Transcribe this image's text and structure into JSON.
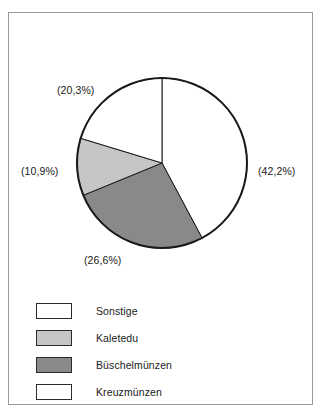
{
  "chart_data": {
    "type": "pie",
    "title": "",
    "subtitle": "",
    "xlabel": "",
    "ylabel": "",
    "legend_position": "bottom-left",
    "grid": false,
    "start_angle_deg": 0,
    "direction": "clockwise",
    "categories": [
      "Kreuzmünzen",
      "Büschelmünzen",
      "Kaletedu",
      "Sonstige"
    ],
    "values": [
      42.2,
      26.6,
      10.9,
      20.3
    ],
    "value_labels": [
      "(42,2%)",
      "(26,6%)",
      "(10,9%)",
      "(20,3%)"
    ],
    "colors": [
      "#ffffff",
      "#898989",
      "#c6c6c6",
      "#ffffff"
    ],
    "slices": [
      {
        "name": "Kreuzmünzen",
        "value": 42.2,
        "label": "(42,2%)",
        "color": "#ffffff",
        "start_deg": 0,
        "end_deg": 151.9,
        "label_position": "right"
      },
      {
        "name": "Büschelmünzen",
        "value": 26.6,
        "label": "(26,6%)",
        "color": "#898989",
        "start_deg": 151.9,
        "end_deg": 247.7,
        "label_position": "bottom"
      },
      {
        "name": "Kaletedu",
        "value": 10.9,
        "label": "(10,9%)",
        "color": "#c6c6c6",
        "start_deg": 247.7,
        "end_deg": 286.9,
        "label_position": "left"
      },
      {
        "name": "Sonstige",
        "value": 20.3,
        "label": "(20,3%)",
        "color": "#ffffff",
        "start_deg": 286.9,
        "end_deg": 360,
        "label_position": "top-left"
      }
    ]
  },
  "labels": {
    "top_left": "(20,3%)",
    "left": "(10,9%)",
    "right": "(42,2%)",
    "bottom": "(26,6%)"
  },
  "legend": {
    "items": [
      {
        "label": "Sonstige",
        "color": "#ffffff"
      },
      {
        "label": "Kaletedu",
        "color": "#c6c6c6"
      },
      {
        "label": "Büschelmünzen",
        "color": "#898989"
      },
      {
        "label": "Kreuzmünzen",
        "color": "#ffffff"
      }
    ]
  },
  "style": {
    "outline": "#1a1a1a",
    "frame_border": "#9a9a9a",
    "background": "#ffffff"
  }
}
